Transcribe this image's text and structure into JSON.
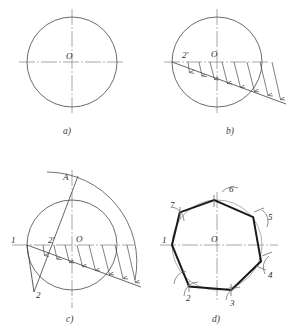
{
  "figure": {
    "type": "geometric-construction-diagram",
    "background_color": "#ffffff",
    "line_color": "#4a4a4a",
    "heavy_line_color": "#1a1a1a",
    "centerline_color": "#7a7a7a"
  },
  "panels": [
    {
      "id": "a",
      "caption": "a)",
      "description": "Given circle with horizontal and vertical centre lines",
      "center_label": "O",
      "circle": {
        "cx": 72,
        "cy": 62,
        "r": 45
      }
    },
    {
      "id": "b",
      "caption": "b)",
      "description": "Diameter divided into seven equal parts and transferred by parallel projection lines",
      "center_label": "O",
      "labels": [
        {
          "text": "2'",
          "x": 186,
          "y": 58
        },
        {
          "text": "O",
          "x": 215,
          "y": 57
        }
      ],
      "circle": {
        "cx": 217,
        "cy": 62,
        "r": 45
      },
      "divisions": 7
    },
    {
      "id": "c",
      "caption": "c)",
      "description": "Arc of radius equal to the diameter struck from point 1 meets the vertical centre line at A; line A-2' extended cuts the circle at point 2",
      "center_label": "O",
      "labels": [
        {
          "text": "A",
          "x": 66,
          "y": 180
        },
        {
          "text": "1",
          "x": 13,
          "y": 240
        },
        {
          "text": "2'",
          "x": 51,
          "y": 240
        },
        {
          "text": "O",
          "x": 79,
          "y": 239
        },
        {
          "text": "2",
          "x": 38,
          "y": 294
        }
      ],
      "circle": {
        "cx": 72,
        "cy": 245,
        "r": 45
      },
      "divisions": 7
    },
    {
      "id": "d",
      "caption": "d)",
      "description": "Chord 1-2 stepped around the circle gives the seven vertices of the regular heptagon",
      "center_label": "O",
      "vertices": [
        {
          "label": "1",
          "x": 14,
          "y": 247
        },
        {
          "label": "2",
          "x": 44,
          "y": 304
        },
        {
          "label": "3",
          "x": 88,
          "y": 311
        },
        {
          "label": "4",
          "x": 123,
          "y": 285
        },
        {
          "label": "5",
          "x": 128,
          "y": 227
        },
        {
          "label": "6",
          "x": 85,
          "y": 190
        },
        {
          "label": "7",
          "x": 38,
          "y": 200
        }
      ],
      "circle": {
        "cx": 217,
        "cy": 245,
        "r": 45
      },
      "sides": 7
    }
  ]
}
